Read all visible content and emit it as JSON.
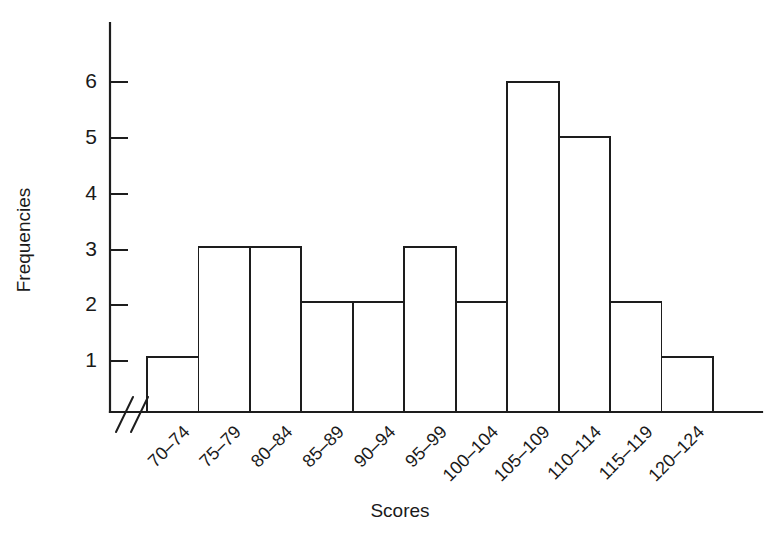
{
  "chart_data": {
    "type": "bar",
    "title": "",
    "subtitle": "",
    "xlabel": "Scores",
    "ylabel": "Frequencies",
    "categories": [
      "70–74",
      "75–79",
      "80–84",
      "85–89",
      "90–94",
      "95–99",
      "100–104",
      "105–109",
      "110–114",
      "115–119",
      "120–124"
    ],
    "values": [
      1,
      3,
      3,
      2,
      2,
      3,
      2,
      6,
      5,
      2,
      1
    ],
    "ytick_labels": [
      "1",
      "2",
      "3",
      "4",
      "5",
      "6"
    ],
    "ytick_values": [
      1,
      2,
      3,
      4,
      5,
      6
    ],
    "ylim": [
      0,
      7
    ],
    "grid": false,
    "legend": false,
    "legend_position": "none",
    "bar_fill": "none",
    "bar_stroke": "#1d1d1d",
    "background": "#ffffff",
    "axis_break": "//",
    "axis_break_note": "double slash axis break on x-axis near origin",
    "xtick_label_rotation": 45
  },
  "axes": {
    "y_title": "Frequencies",
    "x_title": "Scores"
  }
}
